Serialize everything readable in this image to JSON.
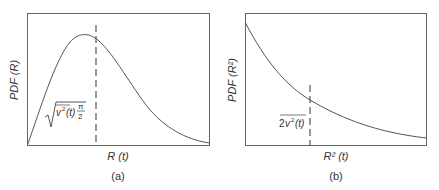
{
  "panels": [
    {
      "id": "a",
      "caption": "(a)",
      "ylabel": "PDF (R)",
      "xlabel": "R (t)",
      "annotation": "√( v²(t) π/2 )",
      "annotation_parts": {
        "var": "v",
        "sup": "2",
        "arg": "(t)",
        "frac_num": "π",
        "frac_den": "2"
      },
      "curve": "Rayleigh distribution",
      "marker": "dashed vertical line at mean"
    },
    {
      "id": "b",
      "caption": "(b)",
      "ylabel": "PDF (R²)",
      "xlabel": "R² (t)",
      "annotation": "2v²(t) (overlined)",
      "annotation_parts": {
        "coef": "2",
        "var": "v",
        "sup": "2",
        "arg": "(t)"
      },
      "curve": "Exponential distribution",
      "marker": "dashed vertical line at mean"
    }
  ],
  "colors": {
    "line": "#555555",
    "text": "#333333",
    "background": "#ffffff"
  }
}
